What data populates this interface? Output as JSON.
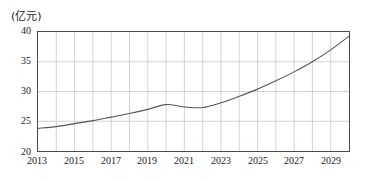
{
  "chart_data": {
    "type": "line",
    "title": "",
    "subtitle": "",
    "unit_label": "(亿元)",
    "xlabel": "",
    "ylabel": "",
    "ylim": [
      20,
      40
    ],
    "xlim": [
      2013,
      2030
    ],
    "yticks": [
      20,
      25,
      30,
      35,
      40
    ],
    "ytick_labels": [
      "20",
      "25",
      "30",
      "35",
      "40"
    ],
    "xticks": [
      2013,
      2015,
      2017,
      2019,
      2021,
      2023,
      2025,
      2027,
      2029
    ],
    "xtick_labels": [
      "2013",
      "2015",
      "2017",
      "2019",
      "2021",
      "2023",
      "2025",
      "2027",
      "2029"
    ],
    "grid": true,
    "grid_x_years": [
      2013,
      2014,
      2015,
      2016,
      2017,
      2018,
      2019,
      2020,
      2021,
      2022,
      2023,
      2024,
      2025,
      2026,
      2027,
      2028,
      2029,
      2030
    ],
    "legend": "none",
    "legend_position": "none",
    "line_color": "#555555",
    "grid_color": "#c8c8c8",
    "axis_color": "#4a4a4a",
    "x": [
      2013,
      2014,
      2015,
      2016,
      2017,
      2018,
      2019,
      2020,
      2021,
      2022,
      2023,
      2024,
      2025,
      2026,
      2027,
      2028,
      2029,
      2030
    ],
    "values": [
      23.8,
      24.1,
      24.6,
      25.1,
      25.7,
      26.3,
      27.0,
      27.8,
      27.4,
      27.3,
      28.1,
      29.2,
      30.4,
      31.8,
      33.3,
      35.0,
      37.0,
      39.3
    ],
    "series": [
      {
        "name": "",
        "values": [
          23.8,
          24.1,
          24.6,
          25.1,
          25.7,
          26.3,
          27.0,
          27.8,
          27.4,
          27.3,
          28.1,
          29.2,
          30.4,
          31.8,
          33.3,
          35.0,
          37.0,
          39.3
        ]
      }
    ],
    "annotations": []
  }
}
